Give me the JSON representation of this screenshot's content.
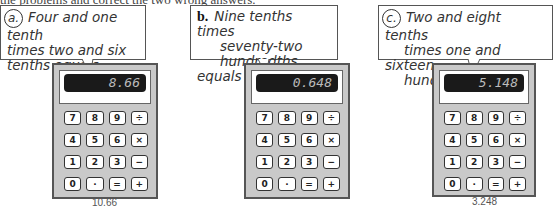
{
  "instruction": "the problems and correct the two wrong answers.",
  "problems": [
    {
      "label": "a.",
      "question": [
        "Four and one tenth",
        "times two and six",
        "tenths equals"
      ],
      "display": "8.66",
      "correction": "10.66",
      "circled": true
    },
    {
      "label": "b.",
      "question": [
        "Nine tenths times",
        "seventy-two",
        "hundredths equals"
      ],
      "display": "0.648",
      "correction": "",
      "circled": false
    },
    {
      "label": "c.",
      "question": [
        "Two and eight tenths",
        "times one and sixteen",
        "hundredths equals"
      ],
      "display": "5.148",
      "correction": "3.248",
      "circled": true
    }
  ],
  "keys": [
    "7",
    "8",
    "9",
    "÷",
    "4",
    "5",
    "6",
    "×",
    "1",
    "2",
    "3",
    "−",
    "0",
    "·",
    "=",
    "+"
  ]
}
